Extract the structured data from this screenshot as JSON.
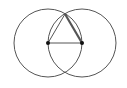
{
  "diagram": {
    "stroke_color": "#555555",
    "point_color": "#111111",
    "circles": [
      {
        "name": "circle-left",
        "cx": 48,
        "cy": 43,
        "r": 34
      },
      {
        "name": "circle-right",
        "cx": 82,
        "cy": 43,
        "r": 34
      }
    ],
    "points": [
      {
        "name": "point-a",
        "x": 48,
        "y": 43
      },
      {
        "name": "point-b",
        "x": 82,
        "y": 43
      },
      {
        "name": "point-c",
        "x": 65,
        "y": 14
      }
    ],
    "segments": [
      {
        "name": "segment-ab",
        "from": "point-a",
        "to": "point-b",
        "width": 1
      },
      {
        "name": "segment-ac",
        "from": "point-a",
        "to": "point-c",
        "width": 1
      },
      {
        "name": "segment-cb",
        "from": "point-c",
        "to": "point-b",
        "width": 2.2
      }
    ]
  }
}
